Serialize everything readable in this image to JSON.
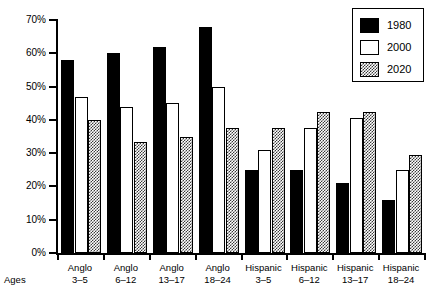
{
  "chart_data": {
    "type": "bar",
    "title": "",
    "xlabel": "Ages",
    "ylabel": "",
    "ylim": [
      0,
      70
    ],
    "ytick_labels": [
      "0%",
      "10%",
      "20%",
      "30%",
      "40%",
      "50%",
      "60%",
      "70%"
    ],
    "ytick_values": [
      0,
      10,
      20,
      30,
      40,
      50,
      60,
      70
    ],
    "grid": false,
    "legend_position": "top-right",
    "categories": [
      "Anglo 3–5",
      "Anglo 6–12",
      "Anglo 13–17",
      "Anglo 18–24",
      "Hispanic 3–5",
      "Hispanic 6–12",
      "Hispanic 13–17",
      "Hispanic 18–24"
    ],
    "category_lines": [
      {
        "line1": "Anglo",
        "line2": "3–5"
      },
      {
        "line1": "Anglo",
        "line2": "6–12"
      },
      {
        "line1": "Anglo",
        "line2": "13–17"
      },
      {
        "line1": "Anglo",
        "line2": "18–24"
      },
      {
        "line1": "Hispanic",
        "line2": "3–5"
      },
      {
        "line1": "Hispanic",
        "line2": "6–12"
      },
      {
        "line1": "Hispanic",
        "line2": "13–17"
      },
      {
        "line1": "Hispanic",
        "line2": "18–24"
      }
    ],
    "series": [
      {
        "name": "1980",
        "fill": "solid-black",
        "color": "#000000",
        "values": [
          58,
          60,
          62,
          68,
          25,
          25,
          21,
          16
        ]
      },
      {
        "name": "2000",
        "fill": "white-outline",
        "color": "#ffffff",
        "values": [
          47,
          44,
          45,
          50,
          31,
          37.5,
          40.5,
          25
        ]
      },
      {
        "name": "2020",
        "fill": "checkered",
        "color": "#3a3a3a",
        "values": [
          40,
          33.5,
          35,
          37.5,
          37.5,
          42.5,
          42.5,
          29.5
        ]
      }
    ]
  },
  "legend": {
    "items": [
      {
        "label": "1980",
        "swatch": "solid-black"
      },
      {
        "label": "2000",
        "swatch": "white-outline"
      },
      {
        "label": "2020",
        "swatch": "checkered"
      }
    ]
  }
}
